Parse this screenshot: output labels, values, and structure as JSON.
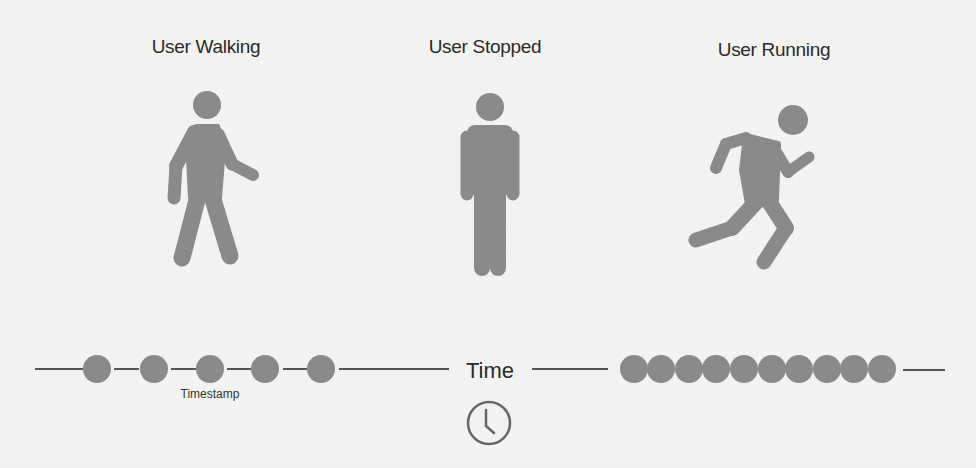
{
  "states": [
    {
      "label": "User Walking",
      "icon": "walking-person-icon"
    },
    {
      "label": "User Stopped",
      "icon": "standing-person-icon"
    },
    {
      "label": "User Running",
      "icon": "running-person-icon"
    }
  ],
  "timeline": {
    "axis_label": "Time",
    "axis_icon": "clock-icon",
    "sparse_segment": {
      "dot_count": 5,
      "caption": "Timestamp"
    },
    "dense_segment": {
      "dot_count": 10
    }
  },
  "colors": {
    "figure": "#8a8a8a",
    "line": "#555555",
    "text": "#2b2b2b",
    "background": "#f3f3f1"
  }
}
